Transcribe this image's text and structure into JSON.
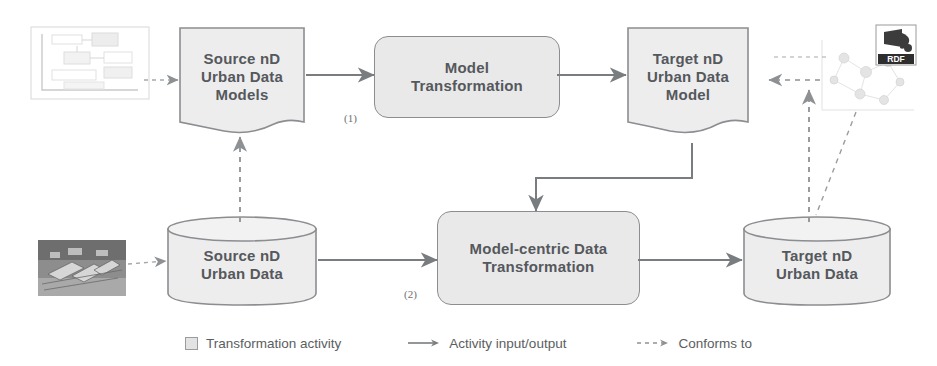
{
  "diagram": {
    "nodes": {
      "source_models": {
        "label": "Source nD\nUrban Data\nModels",
        "shape": "document"
      },
      "model_transformation": {
        "label": "Model\nTransformation",
        "shape": "process"
      },
      "target_model": {
        "label": "Target nD\nUrban Data\nModel",
        "shape": "document"
      },
      "source_data": {
        "label": "Source nD\nUrban Data",
        "shape": "cylinder"
      },
      "model_centric_transformation": {
        "label": "Model-centric Data\nTransformation",
        "shape": "process"
      },
      "target_data": {
        "label": "Target nD\nUrban Data",
        "shape": "cylinder"
      }
    },
    "step_labels": {
      "step_one": "(1)",
      "step_two": "(2)"
    },
    "side_images": {
      "document_thumbnail": "schema-document-thumbnail",
      "aerial_photo": "urban-aerial-photo-thumbnail",
      "rdf_graph": "rdf-graph-thumbnail",
      "rdf_logo_text": "RDF"
    },
    "legend": {
      "items": [
        {
          "key": "transformation-activity",
          "marker": "square",
          "label": "Transformation activity"
        },
        {
          "key": "activity-input-output",
          "marker": "solid-arrow",
          "label": "Activity input/output"
        },
        {
          "key": "conforms-to",
          "marker": "dashed-arrow",
          "label": "Conforms to"
        }
      ]
    },
    "colors": {
      "node_fill": "#ededee",
      "process_fill": "#e9e9ea",
      "stroke": "#8b8d90",
      "text": "#55585c",
      "connector": "#7a7d80",
      "background": "#ffffff"
    }
  }
}
